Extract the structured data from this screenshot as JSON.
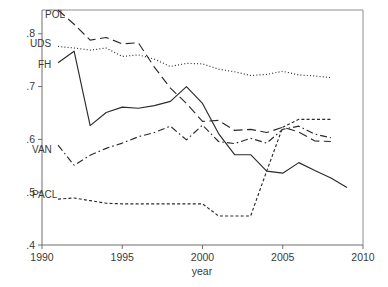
{
  "chart_data": {
    "type": "line",
    "title": "",
    "xlabel": "year",
    "ylabel": "",
    "xlim": [
      1990,
      2010
    ],
    "ylim": [
      0.4,
      0.845
    ],
    "grid": false,
    "legend_position": "inline-labels",
    "x_ticks": [
      1990,
      1995,
      2000,
      2005,
      2010
    ],
    "x_tick_labels": [
      "1990",
      "1995",
      "2000",
      "2005",
      "2010"
    ],
    "y_ticks": [
      0.4,
      0.5,
      0.6,
      0.7,
      0.8
    ],
    "y_tick_labels": [
      ".4",
      ".5",
      ".6",
      ".7",
      ".8"
    ],
    "series": [
      {
        "name": "POL",
        "label": "POL",
        "dash": "long-dash",
        "x": [
          1991,
          1992,
          1993,
          1994,
          1995,
          1996,
          1997,
          1998,
          1999,
          2000,
          2001,
          2002,
          2003,
          2004,
          2005,
          2006,
          2007,
          2008
        ],
        "values": [
          0.845,
          0.818,
          0.788,
          0.793,
          0.781,
          0.783,
          0.737,
          0.697,
          0.668,
          0.634,
          0.636,
          0.617,
          0.619,
          0.613,
          0.623,
          0.614,
          0.597,
          0.596
        ]
      },
      {
        "name": "UDS",
        "label": "UDS",
        "dash": "dotted",
        "x": [
          1991,
          1992,
          1993,
          1994,
          1995,
          1996,
          1997,
          1998,
          1999,
          2000,
          2001,
          2002,
          2003,
          2004,
          2005,
          2006,
          2007,
          2008
        ],
        "values": [
          0.776,
          0.773,
          0.769,
          0.773,
          0.757,
          0.76,
          0.752,
          0.738,
          0.744,
          0.743,
          0.733,
          0.728,
          0.721,
          0.723,
          0.729,
          0.722,
          0.72,
          0.717
        ]
      },
      {
        "name": "FH",
        "label": "FH",
        "dash": "solid",
        "x": [
          1991,
          1992,
          1993,
          1994,
          1995,
          1996,
          1997,
          1998,
          1999,
          2000,
          2001,
          2002,
          2003,
          2004,
          2005,
          2006,
          2007,
          2008,
          2009
        ],
        "values": [
          0.745,
          0.767,
          0.626,
          0.651,
          0.661,
          0.659,
          0.664,
          0.672,
          0.7,
          0.668,
          0.611,
          0.571,
          0.571,
          0.54,
          0.536,
          0.556,
          0.541,
          0.527,
          0.509
        ]
      },
      {
        "name": "VAN",
        "label": "VAN",
        "dash": "dash-dot",
        "x": [
          1991,
          1992,
          1993,
          1994,
          1995,
          1996,
          1997,
          1998,
          1999,
          2000,
          2001,
          2002,
          2003,
          2004,
          2005,
          2006,
          2007,
          2008
        ],
        "values": [
          0.589,
          0.551,
          0.57,
          0.583,
          0.593,
          0.605,
          0.613,
          0.625,
          0.599,
          0.627,
          0.596,
          0.592,
          0.602,
          0.593,
          0.619,
          0.625,
          0.61,
          0.603
        ]
      },
      {
        "name": "PACL",
        "label": "PACL",
        "dash": "short-dash",
        "x": [
          1991,
          1992,
          1993,
          1994,
          1995,
          1996,
          1997,
          1998,
          1999,
          2000,
          2001,
          2002,
          2003,
          2004,
          2005,
          2006,
          2007,
          2008
        ],
        "values": [
          0.487,
          0.489,
          0.484,
          0.479,
          0.478,
          0.478,
          0.478,
          0.478,
          0.478,
          0.478,
          0.455,
          0.455,
          0.455,
          0.54,
          0.623,
          0.638,
          0.638,
          0.638
        ]
      }
    ],
    "series_labels": [
      {
        "name": "POL",
        "x_px": 45,
        "y_px": 18
      },
      {
        "name": "UDS",
        "x_px": 30,
        "y_px": 47
      },
      {
        "name": "FH",
        "x_px": 38,
        "y_px": 68
      },
      {
        "name": "VAN",
        "x_px": 32,
        "y_px": 153
      },
      {
        "name": "PACL",
        "x_px": 32,
        "y_px": 198
      }
    ]
  }
}
